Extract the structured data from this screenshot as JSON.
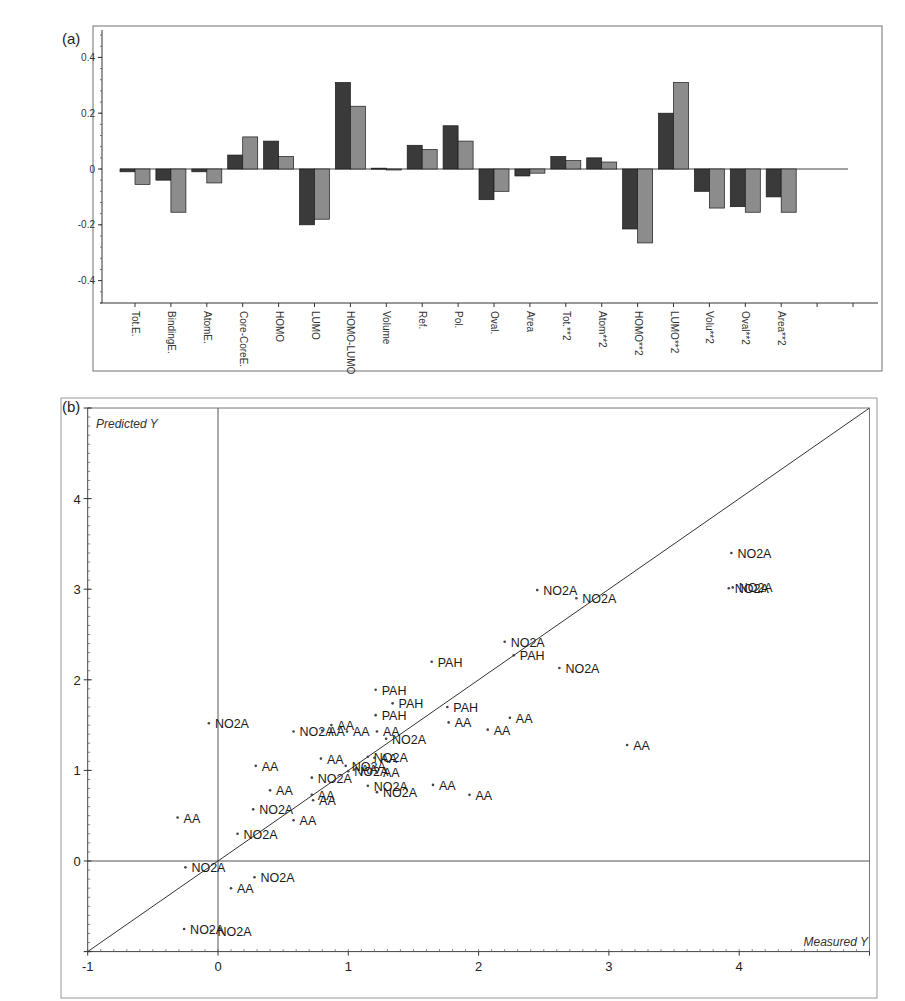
{
  "header": {
    "corner_text": ""
  },
  "chart_data": [
    {
      "id": "a",
      "panel_label": "(a)",
      "type": "bar",
      "title": "",
      "xlabel": "",
      "ylabel": "",
      "ylim": [
        -0.48,
        0.48
      ],
      "yticks": [
        0.4,
        0.2,
        0,
        -0.2,
        -0.4
      ],
      "ytick_labels": [
        "0.4",
        "0.2",
        "0",
        "-0.2",
        "-0.4"
      ],
      "grid": false,
      "legend": null,
      "colors": {
        "series1": "#3a3a3a",
        "series2": "#8c8c8c"
      },
      "categories": [
        "Tot.E.",
        "BindingE.",
        "AtomE.",
        "Core-CoreE.",
        "HOMO",
        "LUMO",
        "HOMO-LUMO",
        "Volume",
        "Ref.",
        "Pol.",
        "Oval.",
        "Area",
        "Tot.**2",
        "Atom**2",
        "HOMO**2",
        "LUMO**2",
        "Volu**2",
        "Oval**2",
        "Area**2"
      ],
      "series": [
        {
          "name": "Component 1 (dark)",
          "values": [
            -0.01,
            -0.04,
            -0.01,
            0.05,
            0.1,
            -0.2,
            0.31,
            0.003,
            0.085,
            0.155,
            -0.11,
            -0.025,
            0.045,
            0.04,
            -0.215,
            0.2,
            -0.08,
            -0.135,
            -0.1
          ]
        },
        {
          "name": "Component 2 (light)",
          "values": [
            -0.055,
            -0.155,
            -0.05,
            0.115,
            0.045,
            -0.18,
            0.225,
            0.0,
            0.07,
            0.1,
            -0.08,
            -0.015,
            0.03,
            0.025,
            -0.265,
            0.31,
            -0.14,
            -0.155,
            -0.155
          ]
        }
      ]
    },
    {
      "id": "b",
      "panel_label": "(b)",
      "type": "scatter",
      "title": "",
      "xlabel": "Measured Y",
      "ylabel": "Predicted Y",
      "xlim": [
        -1,
        5
      ],
      "ylim": [
        -1,
        5
      ],
      "xticks": [
        -1,
        0,
        1,
        2,
        3,
        4,
        5
      ],
      "xtick_labels": [
        "-1",
        "0",
        "1",
        "2",
        "3",
        "4",
        "5"
      ],
      "yticks": [
        -1,
        0,
        1,
        2,
        3,
        4,
        5
      ],
      "ytick_labels": [
        "-1",
        "0",
        "1",
        "2",
        "3",
        "4",
        "5"
      ],
      "grid": false,
      "reference_line": {
        "from": [
          -1,
          -1
        ],
        "to": [
          5,
          5
        ],
        "label": "y = x"
      },
      "zero_lines": true,
      "points": [
        {
          "x": 3.94,
          "y": 3.4,
          "label": "NO2A"
        },
        {
          "x": 3.92,
          "y": 3.01,
          "label": "NO2A"
        },
        {
          "x": 3.95,
          "y": 3.02,
          "label": "NO2A"
        },
        {
          "x": 2.45,
          "y": 2.99,
          "label": "NO2A"
        },
        {
          "x": 2.75,
          "y": 2.9,
          "label": "NO2A"
        },
        {
          "x": 2.2,
          "y": 2.42,
          "label": "NO2A"
        },
        {
          "x": 2.27,
          "y": 2.27,
          "label": "PAH"
        },
        {
          "x": 2.62,
          "y": 2.13,
          "label": "NO2A"
        },
        {
          "x": 1.64,
          "y": 2.2,
          "label": "PAH"
        },
        {
          "x": 1.21,
          "y": 1.89,
          "label": "PAH"
        },
        {
          "x": 1.34,
          "y": 1.74,
          "label": "PAH"
        },
        {
          "x": 1.21,
          "y": 1.61,
          "label": "PAH"
        },
        {
          "x": 1.76,
          "y": 1.7,
          "label": "PAH"
        },
        {
          "x": 1.77,
          "y": 1.53,
          "label": "AA"
        },
        {
          "x": 2.07,
          "y": 1.45,
          "label": "AA"
        },
        {
          "x": 2.24,
          "y": 1.58,
          "label": "AA"
        },
        {
          "x": 3.14,
          "y": 1.28,
          "label": "AA"
        },
        {
          "x": -0.07,
          "y": 1.52,
          "label": "NO2A"
        },
        {
          "x": 0.58,
          "y": 1.43,
          "label": "NO2A"
        },
        {
          "x": 0.87,
          "y": 1.5,
          "label": "AA"
        },
        {
          "x": 0.8,
          "y": 1.44,
          "label": "AA"
        },
        {
          "x": 0.99,
          "y": 1.43,
          "label": "AA"
        },
        {
          "x": 1.22,
          "y": 1.43,
          "label": "AA"
        },
        {
          "x": 1.29,
          "y": 1.35,
          "label": "NO2A"
        },
        {
          "x": 0.79,
          "y": 1.13,
          "label": "AA"
        },
        {
          "x": 1.15,
          "y": 1.15,
          "label": "NO2A"
        },
        {
          "x": 1.2,
          "y": 1.14,
          "label": "AA"
        },
        {
          "x": 0.29,
          "y": 1.05,
          "label": "AA"
        },
        {
          "x": 0.98,
          "y": 1.05,
          "label": "NO2A"
        },
        {
          "x": 1.0,
          "y": 0.99,
          "label": "NO2A"
        },
        {
          "x": 1.05,
          "y": 1.01,
          "label": "AA"
        },
        {
          "x": 1.22,
          "y": 0.98,
          "label": "AA"
        },
        {
          "x": 0.72,
          "y": 0.92,
          "label": "NO2A"
        },
        {
          "x": 1.15,
          "y": 0.83,
          "label": "NO2A"
        },
        {
          "x": 1.65,
          "y": 0.84,
          "label": "AA"
        },
        {
          "x": 0.4,
          "y": 0.78,
          "label": "AA"
        },
        {
          "x": 0.72,
          "y": 0.73,
          "label": "AA"
        },
        {
          "x": 0.73,
          "y": 0.67,
          "label": "AA"
        },
        {
          "x": 1.22,
          "y": 0.76,
          "label": "NO2A"
        },
        {
          "x": 1.93,
          "y": 0.73,
          "label": "AA"
        },
        {
          "x": 0.27,
          "y": 0.57,
          "label": "NO2A"
        },
        {
          "x": 0.58,
          "y": 0.45,
          "label": "AA"
        },
        {
          "x": 0.15,
          "y": 0.3,
          "label": "NO2A"
        },
        {
          "x": -0.31,
          "y": 0.48,
          "label": "AA"
        },
        {
          "x": -0.25,
          "y": -0.07,
          "label": "NO2A"
        },
        {
          "x": 0.28,
          "y": -0.18,
          "label": "NO2A"
        },
        {
          "x": 0.1,
          "y": -0.3,
          "label": "AA"
        },
        {
          "x": -0.26,
          "y": -0.75,
          "label": "NO2A"
        },
        {
          "x": -0.05,
          "y": -0.77,
          "label": "NO2A"
        }
      ]
    }
  ]
}
